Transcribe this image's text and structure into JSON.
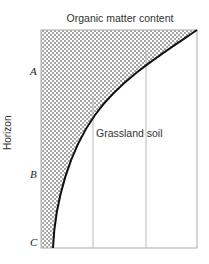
{
  "diagram": {
    "title": "Organic matter content",
    "y_axis_label": "Horizon",
    "horizons": [
      {
        "label": "A"
      },
      {
        "label": "B"
      },
      {
        "label": "C"
      }
    ],
    "curve_label": "Grassland soil",
    "colors": {
      "fill_pattern": "#333333",
      "curve": "#111111",
      "gridline": "#bbbbbb",
      "frame": "#aaaaaa"
    }
  }
}
